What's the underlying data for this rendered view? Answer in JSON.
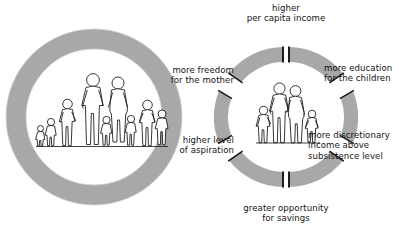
{
  "figure": {
    "name": "virtuous-cycle-of-smaller-family-size",
    "colors": {
      "arrow_fill": "#a8a8a8",
      "ring_fill": "#a8a8a8",
      "stroke": "#141414",
      "figure_fill": "#ffffff",
      "background": "#ffffff"
    }
  },
  "left_panel": {
    "name": "large-family-ring",
    "ring_icon": "thick-gray-circle-ring",
    "family_icon": "large-family-group",
    "family_member_count": 9
  },
  "right_panel": {
    "name": "small-family-cycle",
    "center_family_icon": "small-family-group",
    "center_family_member_count": 4,
    "arrow_count": 6,
    "labels": [
      {
        "id": "higher-per-capita-income",
        "text": "higher\nper capita income",
        "position": "top",
        "align": "center"
      },
      {
        "id": "more-education-for-the-children",
        "text": "more education\nfor the children",
        "position": "upper-right",
        "align": "left"
      },
      {
        "id": "more-discretionary-income-above-subsistence-level",
        "text": "more discretionary\nincome above\nsubsistence level",
        "position": "lower-right",
        "align": "left"
      },
      {
        "id": "greater-opportunity-for-savings",
        "text": "greater opportunity\nfor savings",
        "position": "bottom",
        "align": "center"
      },
      {
        "id": "higher-level-of-aspiration",
        "text": "higher level\nof aspiration",
        "position": "lower-left",
        "align": "right"
      },
      {
        "id": "more-freedom-for-the-mother",
        "text": "more freedom\nfor the mother",
        "position": "upper-left",
        "align": "right"
      }
    ]
  }
}
